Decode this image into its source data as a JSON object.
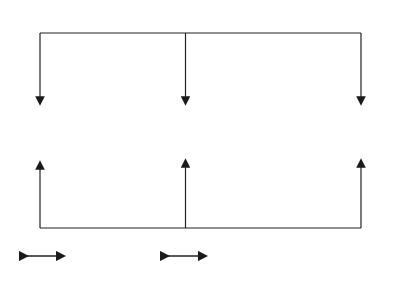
{
  "monitor": {
    "title": "Monitor",
    "notes": [
      {
        "lines": [
          "• Strategic",
          "measures"
        ]
      },
      {
        "lines": [
          "• Output",
          "measures"
        ]
      },
      {
        "lines": [
          "• Operational",
          "measures"
        ]
      }
    ]
  },
  "nodes": [
    {
      "label_lines": [
        "Strategy"
      ]
    },
    {
      "label_lines": [
        "Process",
        "Structure"
      ]
    },
    {
      "label_lines": [
        "Operations",
        "Performance"
      ]
    }
  ],
  "control": {
    "title": "Control",
    "notes": [
      {
        "lines": [
          "• Strategic planning",
          "• Sales, Operation, &",
          "Financial Planning"
        ]
      },
      {
        "lines": [
          "• Value stream or process",
          "management",
          "• Change management"
        ]
      },
      {
        "lines": [
          "• Procedures",
          "• SPC",
          "• Process Control"
        ]
      }
    ]
  },
  "terms": [
    {
      "lines": [
        "Longer",
        "Term"
      ]
    },
    {
      "lines": [
        "Medium",
        "Term"
      ]
    },
    {
      "lines": [
        "Short",
        "Term"
      ]
    }
  ]
}
